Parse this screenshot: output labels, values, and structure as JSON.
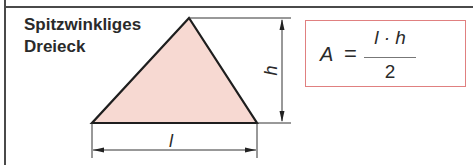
{
  "title": {
    "line1": "Spitzwinkliges",
    "line2": "Dreieck"
  },
  "figure": {
    "shape": "acute-triangle",
    "fill_color": "#f7d9d2",
    "stroke_color": "#1e1e1e",
    "dimensions": {
      "height_label": "h",
      "base_label": "l"
    }
  },
  "formula": {
    "lhs": "A",
    "equals": "=",
    "numerator": "l · h",
    "denominator": "2",
    "border_color": "#e08080"
  }
}
